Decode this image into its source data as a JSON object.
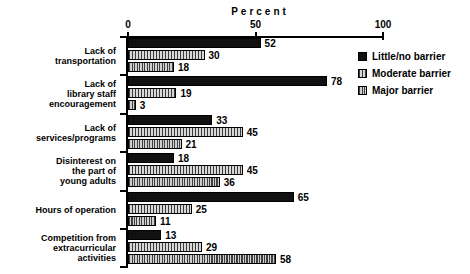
{
  "chart_data": {
    "type": "bar",
    "orientation": "horizontal",
    "title": "Percent",
    "xlabel": "Percent",
    "ylabel": "",
    "xlim": [
      0,
      100
    ],
    "xticks": [
      0,
      50,
      100
    ],
    "xtick_labels": [
      "0",
      "50",
      "100"
    ],
    "grid": false,
    "legend_position": "upper right",
    "categories": [
      "Lack of\ntransportation",
      "Lack of\nlibrary staff\nencouragement",
      "Lack of\nservices/programs",
      "Disinterest on\nthe part of\nyoung adults",
      "Hours of operation",
      "Competition from\nextracurricular\nactivities"
    ],
    "series": [
      {
        "name": "Little/no barrier",
        "values": [
          52,
          78,
          33,
          18,
          65,
          13
        ]
      },
      {
        "name": "Moderate barrier",
        "values": [
          30,
          19,
          45,
          45,
          25,
          29
        ]
      },
      {
        "name": "Major barrier",
        "values": [
          18,
          3,
          21,
          36,
          11,
          58
        ]
      }
    ]
  },
  "legend": {
    "items": [
      {
        "label": "Little/no barrier"
      },
      {
        "label": "Moderate barrier"
      },
      {
        "label": "Major barrier"
      }
    ]
  }
}
